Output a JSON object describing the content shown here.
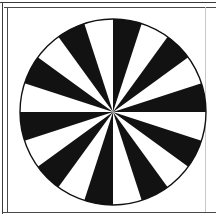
{
  "page": {
    "width": 216,
    "height": 219,
    "background_color": "#ffffff"
  },
  "frame": {
    "top_outer_color": "#3a3a3a",
    "top_inner_color": "#4a4a4a",
    "left_outer_color": "#3a3a3a",
    "left_inner_color": "#4a4a4a",
    "bottom_color": "#4a4a4a",
    "right_color": "#c9c9c9"
  },
  "figure": {
    "name": "radial-sunburst",
    "shape": "circle",
    "center_x": 113,
    "center_y": 112,
    "radius": 93,
    "outline_color": "#111111",
    "outline_width": 1.4,
    "fill_color": "#ffffff",
    "wedge_color": "#121212",
    "gap_color": "#ffffff",
    "segment_count": 20,
    "wedge_count": 10,
    "gap_count": 10,
    "segment_angle_deg": 18,
    "start_angle_deg": -90
  },
  "chart_data": {
    "type": "pie",
    "categories": [
      "seg-1",
      "seg-2",
      "seg-3",
      "seg-4",
      "seg-5",
      "seg-6",
      "seg-7",
      "seg-8",
      "seg-9",
      "seg-10",
      "seg-11",
      "seg-12",
      "seg-13",
      "seg-14",
      "seg-15",
      "seg-16",
      "seg-17",
      "seg-18",
      "seg-19",
      "seg-20"
    ],
    "values": [
      18,
      18,
      18,
      18,
      18,
      18,
      18,
      18,
      18,
      18,
      18,
      18,
      18,
      18,
      18,
      18,
      18,
      18,
      18,
      18
    ],
    "colors": [
      "#121212",
      "#ffffff",
      "#121212",
      "#ffffff",
      "#121212",
      "#ffffff",
      "#121212",
      "#ffffff",
      "#121212",
      "#ffffff",
      "#121212",
      "#ffffff",
      "#121212",
      "#ffffff",
      "#121212",
      "#ffffff",
      "#121212",
      "#ffffff",
      "#121212",
      "#ffffff"
    ],
    "xlabel": "",
    "ylabel": "",
    "legend": [],
    "grid": false
  }
}
